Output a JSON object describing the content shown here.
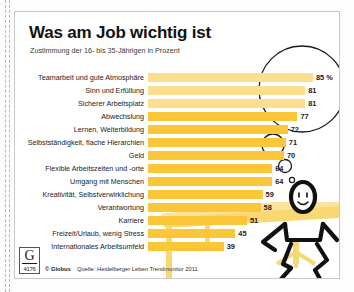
{
  "header": {
    "title": "Was am Job wichtig ist",
    "subtitle": "Zustimmung der 16- bis 35-Jährigen in Prozent"
  },
  "footer": {
    "logo_letter": "G",
    "logo_number": "4176",
    "copyright": "© Globus",
    "source": "Quelle: Heidelberger Leben Trendmonitor 2011"
  },
  "chart_data": {
    "type": "bar",
    "orientation": "horizontal",
    "title": "Was am Job wichtig ist",
    "subtitle": "Zustimmung der 16- bis 35-Jährigen in Prozent",
    "xlabel": "",
    "ylabel": "",
    "xlim": [
      0,
      85
    ],
    "grid": false,
    "legend": false,
    "unit": "Prozent",
    "accent_color": "#fbc638",
    "highlight_color": "#fcdf8e",
    "categories": [
      "Teamarbeit und gute Atmosphäre",
      "Sinn und Erfüllung",
      "Sicherer Arbeitsplatz",
      "Abwechslung",
      "Lernen, Weiterbildung",
      "Selbstständigkeit, flache Hierarchien",
      "Geld",
      "Flexible Arbeitszeiten und -orte",
      "Umgang mit Menschen",
      "Kreativität, Selbstverwirklichung",
      "Verantwortung",
      "Karriere",
      "Freizeit/Urlaub, wenig Stress",
      "Internationales Arbeitsumfeld"
    ],
    "values": [
      85,
      81,
      81,
      77,
      72,
      71,
      70,
      64,
      64,
      59,
      58,
      51,
      45,
      39
    ],
    "value_labels": [
      "85 %",
      "81",
      "81",
      "77",
      "72",
      "71",
      "70",
      "64",
      "64",
      "59",
      "58",
      "51",
      "45",
      "39"
    ],
    "highlighted": [
      true,
      true,
      true,
      false,
      false,
      false,
      false,
      false,
      false,
      false,
      false,
      false,
      false,
      false
    ],
    "annotation": "Die drei wichtigsten Aspekte sind in einer Gedankenblase hervorgehoben"
  },
  "illustration": {
    "name": "stick-figure-at-desk-with-thought-bubble"
  }
}
